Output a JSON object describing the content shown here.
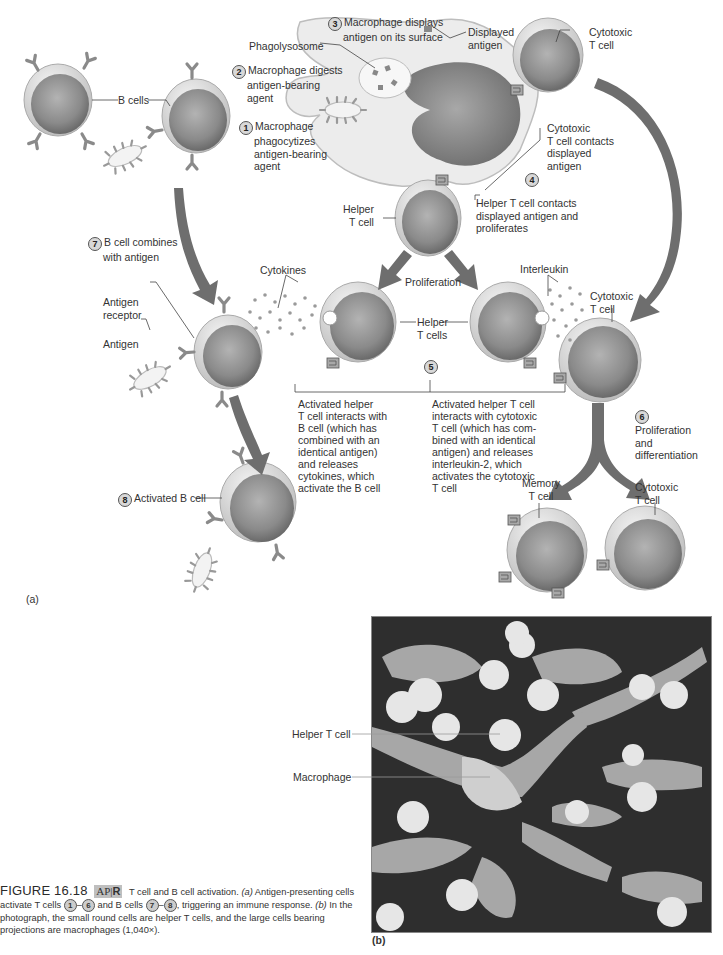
{
  "figure": {
    "number": "FIGURE 16.18",
    "badge": "AP|R",
    "badge_ap": "AP",
    "badge_r": "R",
    "caption_title": "T cell and B cell activation.",
    "caption_a_prefix": "(a)",
    "caption_a_text1": "Antigen-presenting cells activate T cells",
    "caption_a_range1_start": "1",
    "caption_a_range1_end": "6",
    "caption_a_text2": "and B cells",
    "caption_a_range2_start": "7",
    "caption_a_range2_end": "8",
    "caption_a_text3": ", triggering an immune response.",
    "caption_b_prefix": "(b)",
    "caption_b_text": "In the photograph, the small round cells are helper T cells, and the large cells bearing projections are macrophages (1,040×)."
  },
  "panel_a": {
    "label": "(a)",
    "steps": [
      {
        "num": "1",
        "text_lines": [
          "Macrophage",
          "phagocytizes",
          "antigen-bearing",
          "agent"
        ]
      },
      {
        "num": "2",
        "text_lines": [
          "Macrophage digests",
          "antigen-bearing",
          "agent"
        ]
      },
      {
        "num": "3",
        "text_lines": [
          "Macrophage displays",
          "antigen on its surface"
        ]
      },
      {
        "num": "4",
        "text_lines": [
          "Helper T cell contacts",
          "displayed antigen and",
          "proliferates"
        ],
        "text_lines_b": [
          "Cytotoxic",
          "T cell contacts",
          "displayed",
          "antigen"
        ]
      },
      {
        "num": "5",
        "text_left": [
          "Activated helper",
          "T cell interacts with",
          "B cell (which has",
          "combined with an",
          "identical  antigen)",
          "and releases",
          "cytokines, which",
          "activate the B cell"
        ],
        "text_right": [
          "Activated helper T cell",
          "interacts with cytotoxic",
          "T cell (which has com-",
          "bined with an identical",
          "antigen) and releases",
          "interleukin-2, which",
          "activates the cytotoxic",
          "T cell"
        ]
      },
      {
        "num": "6",
        "text_lines": [
          "Proliferation",
          "and",
          "differentiation"
        ]
      },
      {
        "num": "7",
        "text_lines": [
          "B cell combines",
          "with antigen"
        ]
      },
      {
        "num": "8",
        "text_lines": [
          "Activated B cell"
        ]
      }
    ],
    "labels": {
      "phagolysosome": "Phagolysosome",
      "displayed_antigen": [
        "Displayed",
        "antigen"
      ],
      "cytotoxic_t_cell_top": [
        "Cytotoxic",
        "T cell"
      ],
      "b_cells": "B cells",
      "helper_t_cell": [
        "Helper",
        "T cell"
      ],
      "proliferation": "Proliferation",
      "cytokines": "Cytokines",
      "interleukin": "Interleukin",
      "helper_t_cells": [
        "Helper",
        "T cells"
      ],
      "antigen_receptor": [
        "Antigen",
        "receptor"
      ],
      "antigen": "Antigen",
      "cytotoxic_t_cell_mid": [
        "Cytotoxic",
        "T cell"
      ],
      "memory_t_cell": [
        "Memory",
        "T cell"
      ],
      "cytotoxic_t_cell_bottom": [
        "Cytotoxic",
        "T cell"
      ]
    }
  },
  "panel_b": {
    "label": "(b)",
    "labels": {
      "helper_t_cell": "Helper T cell",
      "macrophage": "Macrophage"
    }
  },
  "colors": {
    "arrow": "#6e6e6e",
    "cell_body": "#8f8f8f",
    "cell_rim": "#e2e2e2",
    "macrophage": "#e6e6e6",
    "badge_bg": "#bfbfbf",
    "micrograph_bg": "#2b2b2b"
  }
}
